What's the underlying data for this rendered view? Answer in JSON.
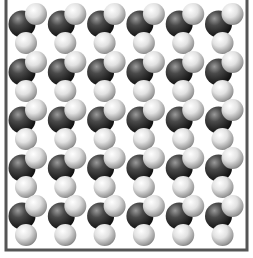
{
  "diagram": {
    "type": "space-filling molecular lattice",
    "frame": {
      "x": 6,
      "y": -2,
      "width": 241,
      "height": 252,
      "stroke": "#555555",
      "stroke_width": 3
    },
    "grid": {
      "columns": 6,
      "rows": 5,
      "origin_x": 22,
      "origin_y": 24,
      "col_spacing": 39.3,
      "row_spacing": 48
    },
    "molecule": {
      "atoms": [
        {
          "role": "central",
          "color": "dark",
          "dx": 0,
          "dy": 0,
          "r": 13.5
        },
        {
          "role": "terminal-upper-right",
          "color": "light",
          "dx": 14,
          "dy": -10,
          "r": 11
        },
        {
          "role": "terminal-bottom",
          "color": "light",
          "dx": 4,
          "dy": 19,
          "r": 11
        }
      ]
    },
    "colors": {
      "dark_highlight": "#8a8a8a",
      "dark_mid": "#3c3c3c",
      "dark_shadow": "#111111",
      "light_highlight": "#ffffff",
      "light_mid": "#d6d6d6",
      "light_shadow": "#7a7a7a",
      "background": "#ffffff"
    }
  }
}
